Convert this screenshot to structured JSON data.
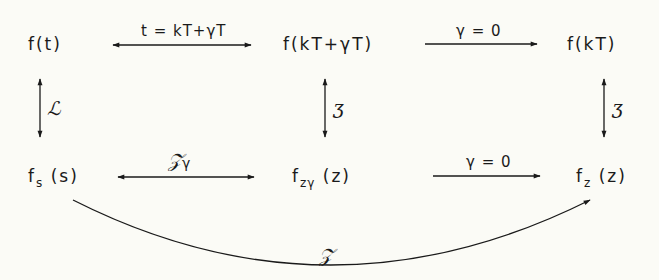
{
  "diagram": {
    "nodes": {
      "f_t": "f(t)",
      "f_kT_gT": "f(kT+γT)",
      "f_kT": "f(kT)",
      "fs_main": "f",
      "fs_sub": "s",
      "fs_arg": " (s)",
      "fzg_main": "f",
      "fzg_sub": "zγ",
      "fzg_arg": "  (z)",
      "fz_main": "f",
      "fz_sub": "z",
      "fz_arg": " (z)"
    },
    "edges": {
      "top_left_label": "t = kT+γT",
      "top_right_label": "γ = 0",
      "bottom_left_label_main": "𝒵",
      "bottom_left_label_sub": "γ",
      "bottom_right_label": "γ = 0",
      "left_vertical_label": "ℒ",
      "middle_vertical_label": "ʒ",
      "right_vertical_label": "ʒ",
      "curve_label": "𝒵"
    },
    "colors": {
      "background": "#fbfbf6",
      "ink": "#1a1a1a"
    }
  }
}
